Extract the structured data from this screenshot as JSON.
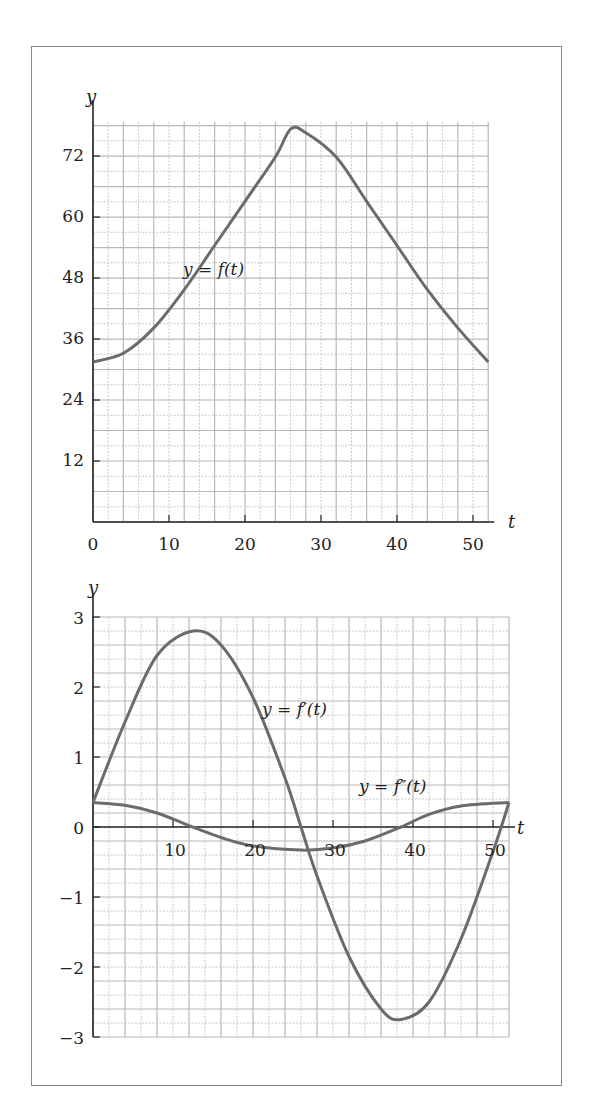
{
  "chart_data": [
    {
      "type": "line",
      "title": "",
      "xlabel": "t",
      "ylabel": "y",
      "xlim": [
        0,
        52
      ],
      "ylim": [
        0,
        78
      ],
      "grid": true,
      "x_ticks": [
        0,
        10,
        20,
        30,
        40,
        50
      ],
      "y_ticks": [
        12,
        24,
        36,
        48,
        60,
        72
      ],
      "x_minor_step": 2,
      "y_minor_step": 3,
      "series": [
        {
          "name": "y = f(t)",
          "x": [
            0,
            4,
            8,
            12,
            16,
            20,
            24,
            26,
            28,
            32,
            36,
            40,
            44,
            48,
            52
          ],
          "values": [
            31.5,
            33.2,
            38.2,
            45.7,
            54.4,
            63.1,
            71.8,
            77.3,
            76.6,
            71.8,
            63.1,
            54.4,
            45.7,
            38.2,
            31.5
          ]
        }
      ],
      "annotations": [
        {
          "text": "y = f(t)",
          "x": 12,
          "y": 49
        }
      ]
    },
    {
      "type": "line",
      "title": "",
      "xlabel": "t",
      "ylabel": "y",
      "xlim": [
        0,
        52
      ],
      "ylim": [
        -3,
        3
      ],
      "grid": true,
      "x_ticks": [
        10,
        20,
        30,
        40,
        50
      ],
      "y_ticks": [
        -3,
        -2,
        -1,
        0,
        1,
        2,
        3
      ],
      "x_minor_step": 2,
      "y_minor_step": 0.2,
      "series": [
        {
          "name": "y = f'(t)",
          "x": [
            0,
            4,
            8,
            12.5,
            16,
            20,
            24,
            26,
            28,
            32,
            36,
            38.5,
            42,
            46,
            50,
            52
          ],
          "values": [
            0.35,
            1.5,
            2.45,
            2.8,
            2.6,
            1.85,
            0.7,
            0,
            -0.7,
            -1.85,
            -2.6,
            -2.75,
            -2.5,
            -1.6,
            -0.35,
            0.35
          ]
        },
        {
          "name": "y = f''(t)",
          "x": [
            0,
            4,
            8,
            12,
            16,
            20,
            26,
            30,
            34,
            38.5,
            42,
            46,
            52
          ],
          "values": [
            0.35,
            0.31,
            0.2,
            0.02,
            -0.15,
            -0.27,
            -0.33,
            -0.3,
            -0.2,
            0,
            0.18,
            0.3,
            0.35
          ]
        }
      ],
      "annotations": [
        {
          "text": "y = f'(t)",
          "x": 21,
          "y": 1.8
        },
        {
          "text": "y = f''(t)",
          "x": 34,
          "y": 0.4
        }
      ]
    }
  ],
  "top_chart": {
    "y_axis_label": "y",
    "x_axis_label": "t",
    "curve_label": "y = f(t)",
    "x_tick_labels": [
      "0",
      "10",
      "20",
      "30",
      "40",
      "50"
    ],
    "y_tick_labels": [
      "12",
      "24",
      "36",
      "48",
      "60",
      "72"
    ]
  },
  "bottom_chart": {
    "y_axis_label": "y",
    "x_axis_label": "t",
    "curve_label_first": "y = f′(t)",
    "curve_label_second": "y = f″(t)",
    "x_tick_labels": [
      "10",
      "20",
      "30",
      "40",
      "50"
    ],
    "y_tick_labels": [
      "3",
      "2",
      "1",
      "0",
      "−1",
      "−2",
      "−3"
    ]
  },
  "colors": {
    "curve": "#6b6b6b",
    "grid_major": "#b8b8b8",
    "grid_minor": "#c8c8c8",
    "axis": "#222222",
    "frame": "#8a8a8a"
  }
}
